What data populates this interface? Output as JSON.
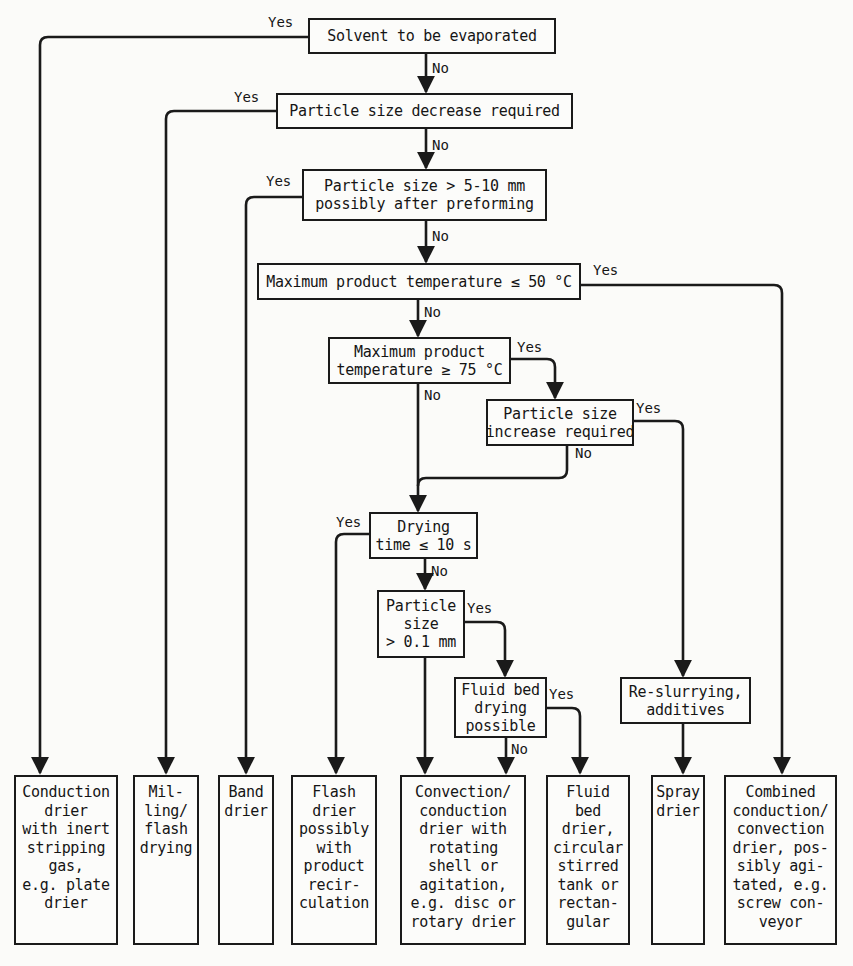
{
  "diagram": {
    "type": "decision-flowchart",
    "topic": "Selection of drier type",
    "decisions": [
      {
        "id": "d1",
        "lines": [
          "Solvent to be evaporated"
        ],
        "yes_to": "o1",
        "no_to": "d2"
      },
      {
        "id": "d2",
        "lines": [
          "Particle size decrease required"
        ],
        "yes_to": "o2",
        "no_to": "d3"
      },
      {
        "id": "d3",
        "lines": [
          "Particle size > 5-10 mm",
          "possibly after preforming"
        ],
        "yes_to": "o3",
        "no_to": "d4"
      },
      {
        "id": "d4",
        "lines": [
          "Maximum product temperature ≤ 50 °C"
        ],
        "yes_to": "o8",
        "no_to": "d5"
      },
      {
        "id": "d5",
        "lines": [
          "Maximum product",
          "temperature ≥ 75 °C"
        ],
        "yes_to": "d6",
        "no_to": "d7"
      },
      {
        "id": "d6",
        "lines": [
          "Particle size",
          "increase required"
        ],
        "yes_to": "p1",
        "no_to": "d7"
      },
      {
        "id": "d7",
        "lines": [
          "Drying",
          "time ≤ 10 s"
        ],
        "yes_to": "o4",
        "no_to": "d8"
      },
      {
        "id": "d8",
        "lines": [
          "Particle",
          "size",
          "> 0.1 mm"
        ],
        "yes_to": "d9",
        "no_to": "o5"
      },
      {
        "id": "d9",
        "lines": [
          "Fluid bed",
          "drying",
          "possible"
        ],
        "yes_to": "o6",
        "no_to": "o5"
      }
    ],
    "processes": [
      {
        "id": "p1",
        "lines": [
          "Re-slurrying,",
          "additives"
        ],
        "to": "o7"
      }
    ],
    "outcomes": [
      {
        "id": "o1",
        "lines": [
          "Conduction",
          "drier",
          "with inert",
          "stripping",
          "gas,",
          "e.g. plate",
          "drier"
        ]
      },
      {
        "id": "o2",
        "lines": [
          "Mil-",
          "ling/",
          "flash",
          "drying"
        ]
      },
      {
        "id": "o3",
        "lines": [
          "Band",
          "drier"
        ]
      },
      {
        "id": "o4",
        "lines": [
          "Flash",
          "drier",
          "possibly",
          "with",
          "product",
          "recir-",
          "culation"
        ]
      },
      {
        "id": "o5",
        "lines": [
          "Convection/",
          "conduction",
          "drier with",
          "rotating",
          "shell or",
          "agitation,",
          "e.g. disc or",
          "rotary drier"
        ]
      },
      {
        "id": "o6",
        "lines": [
          "Fluid",
          "bed",
          "drier,",
          "circular",
          "stirred",
          "tank or",
          "rectan-",
          "gular"
        ]
      },
      {
        "id": "o7",
        "lines": [
          "Spray",
          "drier"
        ]
      },
      {
        "id": "o8",
        "lines": [
          "Combined",
          "conduction/",
          "convection",
          "drier, pos-",
          "sibly agi-",
          "tated, e.g.",
          "screw con-",
          "veyor"
        ]
      }
    ],
    "edge_labels": {
      "yes": "Yes",
      "no": "No"
    }
  },
  "colors": {
    "background": "#fbfbf9",
    "ink": "#1a1a1a"
  }
}
